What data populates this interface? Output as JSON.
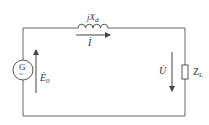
{
  "diagram": {
    "type": "circuit",
    "colors": {
      "wire": "#555555",
      "text": "#333333",
      "background": "#ffffff"
    },
    "components": {
      "generator": {
        "symbol": "G",
        "tilde": "~"
      },
      "reactance": {
        "label_prefix": "jX",
        "label_sub": "d"
      },
      "load": {
        "label_prefix": "Z",
        "label_sub": "L"
      }
    },
    "quantities": {
      "emf": {
        "label": "Ė",
        "sub": "0",
        "direction": "up"
      },
      "current": {
        "label": "İ",
        "direction": "right"
      },
      "voltage": {
        "label": "U̇",
        "direction": "down"
      }
    }
  }
}
